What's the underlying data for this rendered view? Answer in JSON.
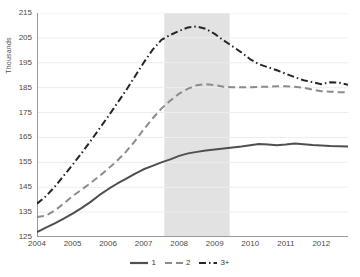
{
  "chart_data": {
    "type": "line",
    "title": "",
    "xlabel": "",
    "ylabel": "Thousands",
    "xlim": [
      2004.0,
      2012.75
    ],
    "ylim": [
      125,
      215
    ],
    "ytick_step": 10,
    "yticks": [
      125,
      135,
      145,
      155,
      165,
      175,
      185,
      195,
      205,
      215
    ],
    "xticks": [
      2004,
      2005,
      2006,
      2007,
      2008,
      2009,
      2010,
      2011,
      2012
    ],
    "grid": "horizontal",
    "legend_position": "bottom-center",
    "annotations": [
      {
        "type": "shaded-band",
        "name": "recession-band",
        "x_start": 2007.58,
        "x_end": 2009.42,
        "color": "#e2e2e2",
        "label": ""
      }
    ],
    "series": [
      {
        "name": "1",
        "style": "solid",
        "color": "#4f4f4f",
        "x": [
          2004.0,
          2004.25,
          2004.5,
          2004.75,
          2005.0,
          2005.25,
          2005.5,
          2005.75,
          2006.0,
          2006.25,
          2006.5,
          2006.75,
          2007.0,
          2007.25,
          2007.5,
          2007.75,
          2008.0,
          2008.25,
          2008.5,
          2008.75,
          2009.0,
          2009.25,
          2009.5,
          2009.75,
          2010.0,
          2010.25,
          2010.5,
          2010.75,
          2011.0,
          2011.25,
          2011.5,
          2011.75,
          2012.0,
          2012.25,
          2012.5,
          2012.75
        ],
        "values": [
          127.0,
          128.8,
          130.5,
          132.4,
          134.4,
          136.6,
          139.0,
          141.8,
          144.2,
          146.4,
          148.4,
          150.4,
          152.2,
          153.6,
          155.0,
          156.2,
          157.6,
          158.6,
          159.2,
          159.8,
          160.2,
          160.6,
          161.0,
          161.4,
          161.9,
          162.4,
          162.2,
          161.9,
          162.2,
          162.6,
          162.3,
          162.0,
          161.8,
          161.6,
          161.5,
          161.4
        ]
      },
      {
        "name": "2",
        "style": "dashed",
        "color": "#8c8c8c",
        "x": [
          2004.0,
          2004.25,
          2004.5,
          2004.75,
          2005.0,
          2005.25,
          2005.5,
          2005.75,
          2006.0,
          2006.25,
          2006.5,
          2006.75,
          2007.0,
          2007.25,
          2007.5,
          2007.75,
          2008.0,
          2008.25,
          2008.5,
          2008.75,
          2009.0,
          2009.25,
          2009.5,
          2009.75,
          2010.0,
          2010.25,
          2010.5,
          2010.75,
          2011.0,
          2011.25,
          2011.5,
          2011.75,
          2012.0,
          2012.25,
          2012.5,
          2012.75
        ],
        "values": [
          133.0,
          133.6,
          135.6,
          138.4,
          141.4,
          144.0,
          146.6,
          149.4,
          152.4,
          155.6,
          159.2,
          163.4,
          168.2,
          172.6,
          176.6,
          179.8,
          182.6,
          184.6,
          186.0,
          186.4,
          186.0,
          185.4,
          185.2,
          185.2,
          185.2,
          185.3,
          185.4,
          185.6,
          185.6,
          185.4,
          185.0,
          184.2,
          183.6,
          183.4,
          183.2,
          183.2
        ]
      },
      {
        "name": "3+",
        "style": "dash-dot",
        "color": "#262626",
        "x": [
          2004.0,
          2004.25,
          2004.5,
          2004.75,
          2005.0,
          2005.25,
          2005.5,
          2005.75,
          2006.0,
          2006.25,
          2006.5,
          2006.75,
          2007.0,
          2007.25,
          2007.5,
          2007.75,
          2008.0,
          2008.25,
          2008.5,
          2008.75,
          2009.0,
          2009.25,
          2009.5,
          2009.75,
          2010.0,
          2010.25,
          2010.5,
          2010.75,
          2011.0,
          2011.25,
          2011.5,
          2011.75,
          2012.0,
          2012.25,
          2012.5,
          2012.75
        ],
        "values": [
          138.4,
          141.4,
          145.2,
          149.6,
          154.0,
          158.6,
          163.4,
          168.4,
          173.4,
          178.6,
          183.8,
          189.4,
          195.0,
          200.2,
          204.2,
          206.2,
          207.8,
          209.2,
          209.6,
          208.6,
          206.6,
          204.0,
          201.6,
          199.2,
          196.4,
          194.4,
          193.2,
          192.0,
          190.6,
          189.2,
          188.0,
          187.2,
          186.4,
          187.2,
          187.0,
          186.2
        ]
      }
    ]
  },
  "axis": {
    "y_title": "Thousands",
    "y_tick_labels": [
      "215",
      "205",
      "195",
      "185",
      "175",
      "165",
      "155",
      "145",
      "135",
      "125"
    ],
    "x_tick_labels": [
      "2004",
      "2005",
      "2006",
      "2007",
      "2008",
      "2009",
      "2010",
      "2011",
      "2012"
    ]
  },
  "legend": {
    "entries": [
      {
        "label": "1",
        "style": "solid",
        "color": "#4f4f4f"
      },
      {
        "label": "2",
        "style": "dashed",
        "color": "#8c8c8c"
      },
      {
        "label": "3+",
        "style": "dash-dot",
        "color": "#262626"
      }
    ]
  },
  "colors": {
    "grid": "#ededed",
    "axis": "#9a9a9a",
    "band": "#e2e2e2",
    "text": "#4a4a4a",
    "background": "#ffffff"
  }
}
